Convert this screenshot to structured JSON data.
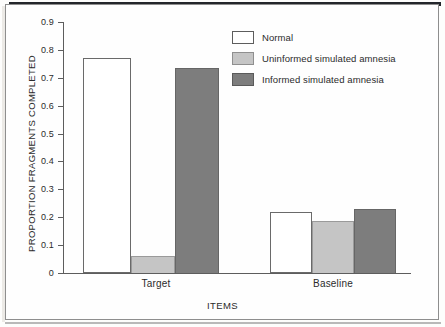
{
  "chart_data": {
    "type": "bar",
    "title": "",
    "xlabel": "ITEMS",
    "ylabel": "PROPORTION FRAGMENTS COMPLETED",
    "categories": [
      "Target",
      "Baseline"
    ],
    "series": [
      {
        "name": "Normal",
        "color": "#ffffff",
        "values": [
          0.77,
          0.219
        ]
      },
      {
        "name": "Uninformed simulated amnesia",
        "color": "#c5c5c5",
        "values": [
          0.061,
          0.186
        ]
      },
      {
        "name": "Informed simulated amnesia",
        "color": "#7d7d7d",
        "values": [
          0.735,
          0.229
        ]
      }
    ],
    "ylim": [
      0,
      0.9
    ],
    "ytick_labels": [
      "0.9",
      "0.8",
      "0.7",
      "0.6",
      "0.5",
      "0.4",
      "0.3",
      "0.2",
      "0.1",
      "0"
    ],
    "ytick_values": [
      0.9,
      0.8,
      0.7,
      0.6,
      0.5,
      0.4,
      0.3,
      0.2,
      0.1,
      0
    ],
    "grid": false,
    "legend_position": "top-right"
  },
  "axes": {
    "y_title": "PROPORTION FRAGMENTS COMPLETED",
    "x_title": "ITEMS",
    "ticks": [
      {
        "label": "0.9"
      },
      {
        "label": "0.8"
      },
      {
        "label": "0.7"
      },
      {
        "label": "0.6"
      },
      {
        "label": "0.5"
      },
      {
        "label": "0.4"
      },
      {
        "label": "0.3"
      },
      {
        "label": "0.2"
      },
      {
        "label": "0.1"
      },
      {
        "label": "0"
      }
    ],
    "groups": [
      {
        "label": "Target"
      },
      {
        "label": "Baseline"
      }
    ]
  },
  "legend": {
    "entries": [
      {
        "label": "Normal",
        "swatch": "normal"
      },
      {
        "label": "Uninformed simulated amnesia",
        "swatch": "uninformed"
      },
      {
        "label": "Informed simulated amnesia",
        "swatch": "informed"
      }
    ]
  }
}
